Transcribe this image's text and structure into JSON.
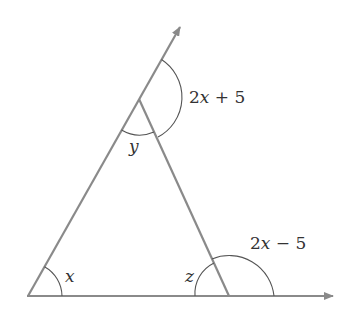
{
  "diagram": {
    "type": "triangle-exterior-angles",
    "colors": {
      "line": "#8a8a8a",
      "arc": "#555555",
      "text": "#333333",
      "background": "#ffffff"
    },
    "vertices": {
      "A": {
        "x": 28,
        "y": 296
      },
      "B": {
        "x": 139,
        "y": 99
      },
      "C": {
        "x": 229,
        "y": 296
      }
    },
    "labels": {
      "angle_A": "x",
      "angle_B": "y",
      "angle_C": "z",
      "exterior_top": "2x + 5",
      "exterior_top_parts": {
        "coef": "2",
        "var": "x",
        "rest": " + 5"
      },
      "exterior_bottom": "2x − 5",
      "exterior_bottom_parts": {
        "coef": "2",
        "var": "x",
        "rest": " − 5"
      }
    },
    "rays": [
      {
        "name": "left-side-extended",
        "from": "A",
        "through": "B",
        "arrow": true
      },
      {
        "name": "base-extended",
        "from": "A",
        "through": "C",
        "arrow": true
      }
    ]
  }
}
